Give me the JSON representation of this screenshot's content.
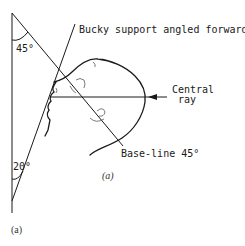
{
  "figure": {
    "labels": {
      "bucky": "Bucky support angled forward",
      "central_ray_line1": "Central",
      "central_ray_line2": "ray",
      "baseline": "Base-line 45°",
      "angle_top": "45°",
      "angle_bottom": "20°",
      "subfig_label": "(a)",
      "caption": "(a)"
    },
    "angles": {
      "baseline_to_vertical_deg": 45,
      "bucky_to_vertical_deg": 20
    },
    "colors": {
      "ink": "#1a1a1a",
      "background": "#ffffff"
    }
  }
}
